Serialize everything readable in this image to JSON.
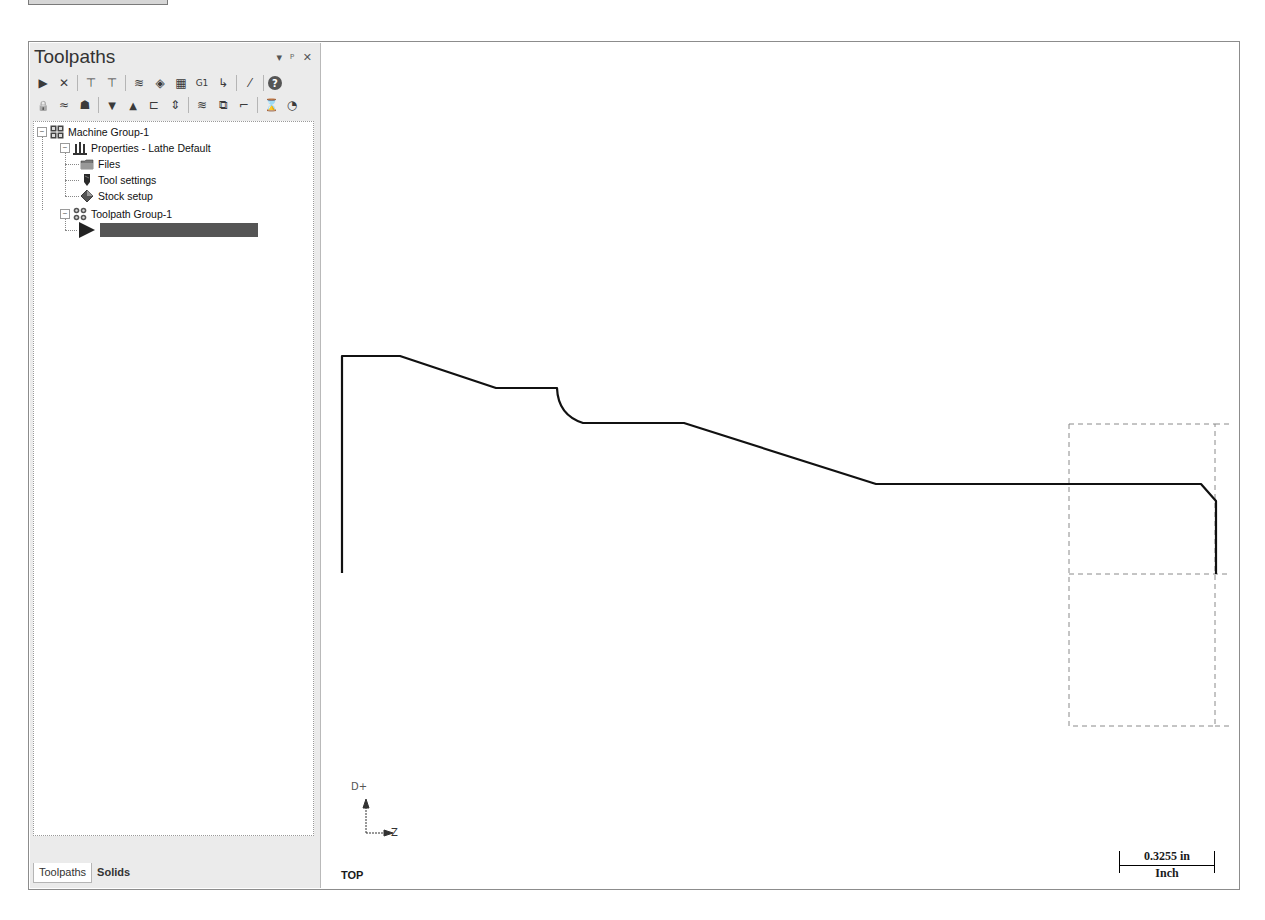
{
  "panel": {
    "title": "Toolpaths",
    "controls": {
      "dropdown": "▾",
      "pin": "ᵖ",
      "close": "✕"
    },
    "toolbar_row1": [
      {
        "name": "select-all-operations-icon",
        "glyph": "▶"
      },
      {
        "name": "deselect-operations-icon",
        "glyph": "✕"
      },
      {
        "name": "regenerate-selected-icon",
        "glyph": "⊤"
      },
      {
        "name": "regenerate-dirty-icon",
        "glyph": "⊤"
      },
      {
        "name": "backplot-icon",
        "glyph": "≋"
      },
      {
        "name": "verify-icon",
        "glyph": "◈"
      },
      {
        "name": "simulate-icon",
        "glyph": "▦"
      },
      {
        "name": "post-selected-g1-icon",
        "glyph": "G1"
      },
      {
        "name": "toolpath-output-icon",
        "glyph": "↳"
      },
      {
        "name": "highfeed-icon",
        "glyph": "⁄"
      },
      {
        "name": "help-icon",
        "glyph": "?"
      }
    ],
    "toolbar_row2": [
      {
        "name": "lock-icon",
        "glyph": "🔒"
      },
      {
        "name": "toggle-display-icon",
        "glyph": "≈"
      },
      {
        "name": "toggle-posting-icon",
        "glyph": "☗"
      },
      {
        "name": "move-down-icon",
        "glyph": "▼"
      },
      {
        "name": "move-up-icon",
        "glyph": "▲"
      },
      {
        "name": "insert-arrow-icon",
        "glyph": "⊏"
      },
      {
        "name": "scroll-to-insert-icon",
        "glyph": "⇕"
      },
      {
        "name": "display-selected-icon",
        "glyph": "≋"
      },
      {
        "name": "display-all-icon",
        "glyph": "⧉"
      },
      {
        "name": "stock-model-icon",
        "glyph": "⌐"
      },
      {
        "name": "gouge-check-icon",
        "glyph": "⌛"
      },
      {
        "name": "options-icon",
        "glyph": "◔"
      }
    ],
    "tree": {
      "machine_group": "Machine Group-1",
      "properties": "Properties - Lathe Default",
      "files": "Files",
      "tool_settings": "Tool settings",
      "stock_setup": "Stock setup",
      "toolpath_group": "Toolpath Group-1",
      "insert_label": ""
    },
    "tabs": [
      {
        "label": "Toolpaths",
        "active": true
      },
      {
        "label": "Solids",
        "active": false
      }
    ]
  },
  "viewport": {
    "view_name": "TOP",
    "axis_vertical": "D+",
    "axis_horizontal": "Z",
    "scale_value": "0.3255 in",
    "scale_unit": "Inch"
  },
  "colors": {
    "panel_bg": "#ebebeb",
    "geometry": "#111111",
    "stock_boundary": "#8a8a8a",
    "selected_row": "#555555"
  }
}
